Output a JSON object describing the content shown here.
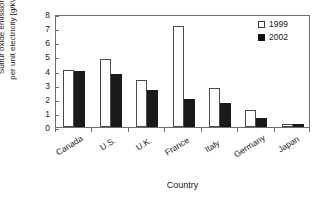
{
  "chart_data": {
    "type": "bar",
    "title": "",
    "xlabel": "Country",
    "ylabel": "Sulfur oxide emissions per unit electricity [g/kWh]",
    "ylabel_line1": "Sulfur oxide emissions",
    "ylabel_line2": "per unit electricity [g/kWh]",
    "categories": [
      "Canada",
      "U.S.",
      "U.K.",
      "France",
      "Italy",
      "Germany",
      "Japan"
    ],
    "series": [
      {
        "name": "1999",
        "color": "#ffffff",
        "values": [
          4.05,
          4.8,
          3.3,
          7.15,
          2.75,
          1.2,
          0.2
        ]
      },
      {
        "name": "2002",
        "color": "#111111",
        "values": [
          3.95,
          3.75,
          2.6,
          2.0,
          1.7,
          0.65,
          0.2
        ]
      }
    ],
    "ylim": [
      0,
      8
    ],
    "yticks": [
      0,
      1,
      2,
      3,
      4,
      5,
      6,
      7,
      8
    ],
    "ytick_labels": [
      "0",
      "1",
      "2",
      "3",
      "4",
      "5",
      "6",
      "7",
      "8"
    ],
    "grid": false,
    "legend_position": "top-right"
  }
}
